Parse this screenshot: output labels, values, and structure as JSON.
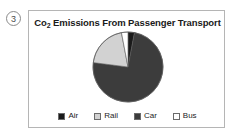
{
  "question": {
    "number": "3"
  },
  "panel": {
    "title_prefix": "Co",
    "title_sub": "2",
    "title_rest": " Emissions From Passenger Transport",
    "title_full": "Co2 Emissions From Passenger Transport",
    "border_color": "#b5b5b5",
    "background": "#ffffff"
  },
  "chart_data": {
    "type": "pie",
    "title": "Co2 Emissions From Passenger Transport",
    "xlabel": "",
    "ylabel": "",
    "legend_position": "bottom",
    "grid": false,
    "start_angle_deg": 0,
    "direction": "clockwise",
    "categories": [
      "Air",
      "Rail",
      "Car",
      "Bus"
    ],
    "values": [
      3,
      20,
      74,
      3
    ],
    "units": "percent",
    "colors": [
      "#1a1a1a",
      "#d2d2d2",
      "#3c3c3c",
      "#ffffff"
    ],
    "slice_order_clockwise_from_12": [
      "Air",
      "Car",
      "Rail",
      "Bus"
    ],
    "slices": [
      {
        "label": "Air",
        "value": 3,
        "color": "#1a1a1a",
        "stroke": "#5a5a5a"
      },
      {
        "label": "Rail",
        "value": 20,
        "color": "#d2d2d2",
        "stroke": "#5a5a5a"
      },
      {
        "label": "Car",
        "value": 74,
        "color": "#3c3c3c",
        "stroke": "#5a5a5a"
      },
      {
        "label": "Bus",
        "value": 3,
        "color": "#ffffff",
        "stroke": "#5a5a5a"
      }
    ]
  },
  "legend": {
    "items": [
      {
        "label": "Air",
        "color": "#1a1a1a"
      },
      {
        "label": "Rail",
        "color": "#d2d2d2"
      },
      {
        "label": "Car",
        "color": "#3c3c3c"
      },
      {
        "label": "Bus",
        "color": "#ffffff"
      }
    ]
  }
}
